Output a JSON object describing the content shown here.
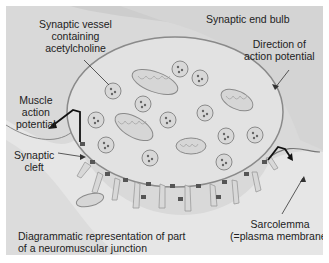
{
  "labels": {
    "synaptic_vessel": [
      "Synaptic vessel",
      "containing",
      "acetylcholine"
    ],
    "synaptic_end_bulb": "Synaptic end bulb",
    "direction": [
      "Direction of",
      "action potential"
    ],
    "muscle_ap": [
      "Muscle",
      "action",
      "potential"
    ],
    "synaptic_cleft": [
      "Synaptic",
      "cleft"
    ],
    "sarcolemma": [
      "Sarcolemma",
      "(=plasma membrane)"
    ],
    "caption": [
      "Diagrammatic representation of part",
      "of a neuromuscular junction"
    ]
  },
  "colors": {
    "background": "#d9d9d9",
    "end_bulb": "#cfcfcf",
    "bulb_fill": "#e3e3e3",
    "muscle": "#e8e8e8",
    "line": "#555555"
  }
}
